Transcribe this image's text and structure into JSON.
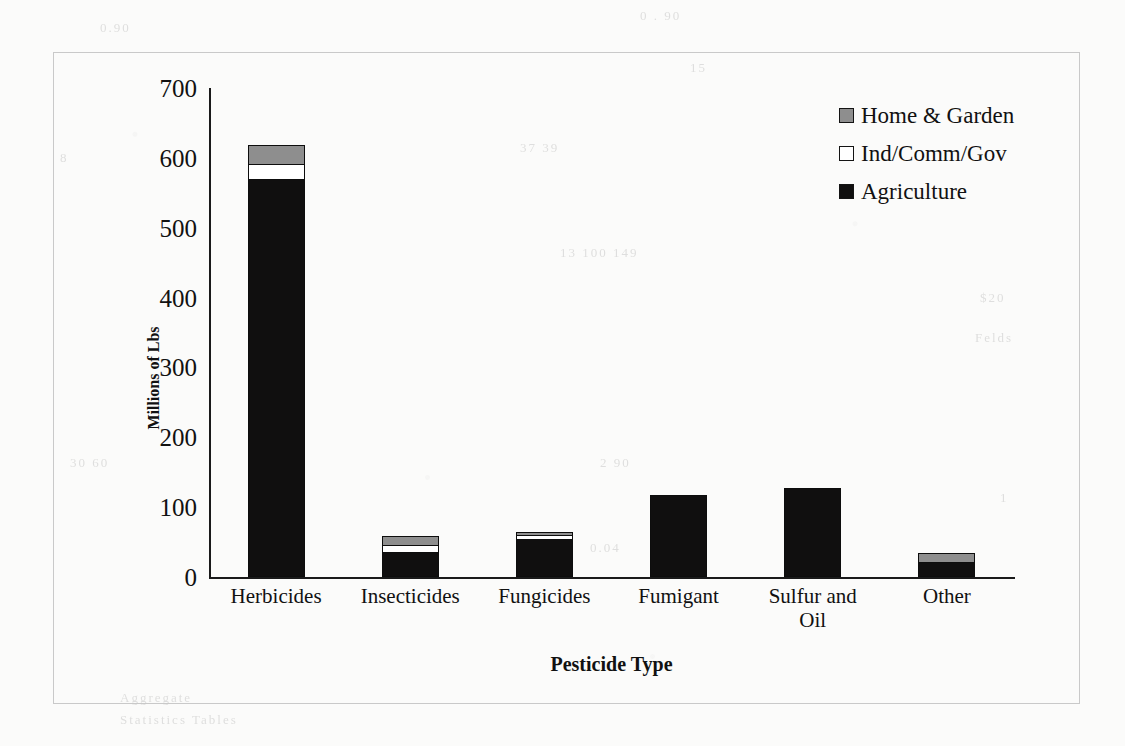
{
  "figure": {
    "y_axis_title": "Millions of Lbs",
    "x_axis_title": "Pesticide Type"
  },
  "legend": {
    "entries": [
      {
        "label": "Home & Garden",
        "swatch": "gray-square-swatch",
        "color": "#8e8e8e"
      },
      {
        "label": "Ind/Comm/Gov",
        "swatch": "white-square-swatch",
        "color": "#ffffff"
      },
      {
        "label": "Agriculture",
        "swatch": "black-square-swatch",
        "color": "#100f0f"
      }
    ]
  },
  "y_ticks": [
    "700",
    "600",
    "500",
    "400",
    "300",
    "200",
    "100",
    "0"
  ],
  "x_ticks": [
    {
      "line1": "Herbicides",
      "line2": ""
    },
    {
      "line1": "Insecticides",
      "line2": ""
    },
    {
      "line1": "Fungicides",
      "line2": ""
    },
    {
      "line1": "Fumigant",
      "line2": ""
    },
    {
      "line1": "Sulfur and",
      "line2": "Oil"
    },
    {
      "line1": "Other",
      "line2": ""
    }
  ],
  "ghost_text": [
    {
      "text": "0 . 90",
      "left": 640,
      "top": 8
    },
    {
      "text": "15",
      "left": 690,
      "top": 60
    },
    {
      "text": "37 39",
      "left": 520,
      "top": 140
    },
    {
      "text": "13 100 149",
      "left": 560,
      "top": 245
    },
    {
      "text": "$20",
      "left": 980,
      "top": 290
    },
    {
      "text": "Felds",
      "left": 975,
      "top": 330
    },
    {
      "text": "2 90",
      "left": 600,
      "top": 455
    },
    {
      "text": "1",
      "left": 1000,
      "top": 490
    },
    {
      "text": "0.04",
      "left": 590,
      "top": 540
    },
    {
      "text": "0.90",
      "left": 100,
      "top": 20
    },
    {
      "text": "8",
      "left": 60,
      "top": 150
    },
    {
      "text": "30 60",
      "left": 70,
      "top": 455
    },
    {
      "text": "Aggregate",
      "left": 120,
      "top": 690
    },
    {
      "text": "Statistics Tables",
      "left": 120,
      "top": 712
    }
  ],
  "chart_data": {
    "type": "bar",
    "subtype": "stacked-vertical",
    "title": "",
    "xlabel": "Pesticide Type",
    "ylabel": "Millions of Lbs",
    "ylim": [
      0,
      700
    ],
    "ytick_step": 100,
    "grid": false,
    "legend_position": "top-right",
    "categories": [
      "Herbicides",
      "Insecticides",
      "Fungicides",
      "Fumigant",
      "Sulfur and Oil",
      "Other"
    ],
    "series": [
      {
        "name": "Agriculture",
        "color": "#100f0f",
        "values": [
          570,
          36,
          55,
          117,
          128,
          21
        ]
      },
      {
        "name": "Ind/Comm/Gov",
        "color": "#ffffff",
        "values": [
          23,
          11,
          6,
          0,
          0,
          0
        ]
      },
      {
        "name": "Home & Garden",
        "color": "#8e8e8e",
        "values": [
          28,
          15,
          6,
          0,
          0,
          15
        ]
      }
    ],
    "totals": [
      621,
      62,
      67,
      117,
      128,
      36
    ]
  }
}
